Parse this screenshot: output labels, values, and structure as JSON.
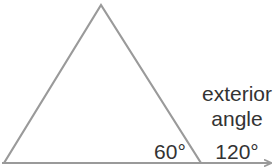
{
  "diagram": {
    "type": "triangle-exterior-angle",
    "colors": {
      "line": "#9a9a9a",
      "text": "#333333",
      "background": "#ffffff"
    },
    "vertices": {
      "apex": [
        101,
        5
      ],
      "left": [
        4,
        163
      ],
      "right": [
        201,
        163
      ]
    },
    "baseline": {
      "start": [
        2,
        163
      ],
      "end": [
        272,
        163
      ],
      "arrow": true
    },
    "labels": {
      "interior_angle": "60°",
      "exterior_line1": "exterior",
      "exterior_line2": "angle",
      "exterior_angle": "120°"
    }
  }
}
